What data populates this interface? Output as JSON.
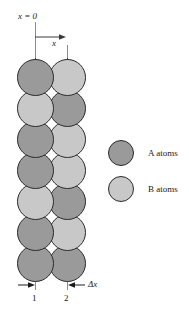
{
  "figure": {
    "type": "atom-lattice-diffusion-diagram",
    "background_color": "#ffffff",
    "width": 189,
    "height": 312
  },
  "colors": {
    "atom_a": "#9a9a9a",
    "atom_b": "#c8c8c8",
    "outline": "#2b2b2b",
    "axis_line": "#3a3a3a",
    "axis_line_faint": "#8c8c8c",
    "text": "#1a1a1a"
  },
  "axis": {
    "origin_label": "x = 0",
    "direction_label": "x",
    "plane_1_label": "1",
    "plane_2_label": "2",
    "spacing_label": "Δx"
  },
  "legend": {
    "items": [
      {
        "key": "A",
        "label": "A atoms",
        "color": "#9a9a9a"
      },
      {
        "key": "B",
        "label": "B atoms",
        "color": "#c8c8c8"
      }
    ]
  },
  "lattice": {
    "columns": 2,
    "rows": 7,
    "diameter": 37,
    "row_pitch": 31,
    "column_x_centers": [
      35,
      67
    ],
    "first_row_center_y": 77,
    "grid": [
      [
        "A",
        "B"
      ],
      [
        "B",
        "A"
      ],
      [
        "A",
        "B"
      ],
      [
        "A",
        "B"
      ],
      [
        "B",
        "A"
      ],
      [
        "A",
        "B"
      ],
      [
        "A",
        "A"
      ]
    ]
  }
}
